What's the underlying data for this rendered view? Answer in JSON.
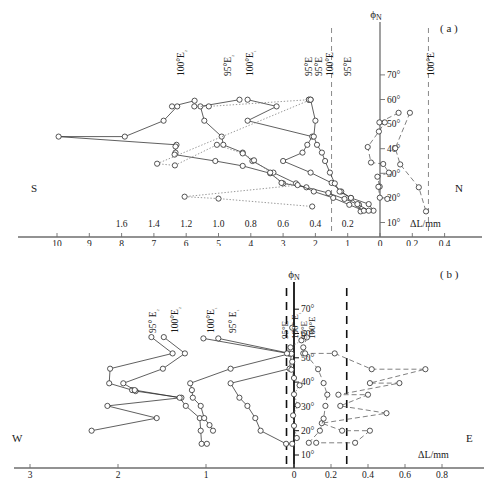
{
  "figure": {
    "panels": [
      {
        "id": "a",
        "tag": "( a )",
        "left_direction": "S",
        "right_direction": "N",
        "yaxis_symbol": "ϕ",
        "yaxis_subscript": "N",
        "xaxis_label": "ΔL/mm",
        "lat_ticks": [
          "10°",
          "20°",
          "30°",
          "40°",
          "50°",
          "60°",
          "70°"
        ],
        "upper_scale_ticks": [
          "1.6",
          "1.4",
          "1.2",
          "1.0",
          "0.8",
          "0.6",
          "0.4",
          "0.2"
        ],
        "lower_scale_ticks": [
          "10",
          "9",
          "8",
          "7",
          "6",
          "5",
          "4",
          "3",
          "2",
          "1",
          "0",
          "0.2",
          "0.4"
        ],
        "series_labels_top": [
          "100°E₂",
          "95°E₂",
          "100°E₁",
          "95°E",
          "95°E",
          "100°E"
        ],
        "series_labels_right": [
          "95°E",
          "100°E"
        ],
        "dashed_guides": [
          1.5,
          -0.3
        ]
      },
      {
        "id": "b",
        "tag": "( b )",
        "left_direction": "W",
        "right_direction": "E",
        "yaxis_symbol": "ϕ",
        "yaxis_subscript": "N",
        "xaxis_label": "ΔL/mm",
        "lat_ticks": [
          "10°",
          "20°",
          "30°",
          "40°",
          "50°",
          "60°",
          "70°"
        ],
        "lower_scale_ticks": [
          "3",
          "2",
          "1",
          "0",
          "0.2",
          "0.4",
          "0.6",
          "0.8"
        ],
        "series_labels_top": [
          "95° E₂",
          "100°E₂",
          "100°E₁",
          "95° E₁"
        ],
        "series_labels_axis": [
          "95°E",
          "100° E₁",
          "95°E",
          "100°E"
        ],
        "dashed_guides": [
          -0.08,
          0.285
        ]
      }
    ]
  },
  "chart_data": [
    {
      "type": "scatter",
      "panel": "a",
      "title": "",
      "xlabel": "ΔL/mm",
      "ylabel": "ϕN",
      "xlim": [
        10.2,
        -0.5
      ],
      "ylim": [
        5,
        75
      ],
      "grid": false,
      "legend": "inline-rotated-labels",
      "note": "Left of zero uses coarse scale (10..0 mm), right of zero uses fine scale (0..0.4 mm). Secondary upper tick row 1.6..0.2 aligns with lower 8..1.",
      "series": [
        {
          "name": "100°E₂",
          "style": "solid",
          "points": [
            [
              5.74,
              59.5
            ],
            [
              6.44,
              57.2
            ],
            [
              6.28,
              57.2
            ],
            [
              6.7,
              51.4
            ],
            [
              7.9,
              44.9
            ],
            [
              9.95,
              44.9
            ],
            [
              6.3,
              41.6
            ],
            [
              6.33,
              40.9
            ],
            [
              6.33,
              38.4
            ],
            [
              6.36,
              37.6
            ],
            [
              5.1,
              35.0
            ],
            [
              4.25,
              33.0
            ],
            [
              3.4,
              30.0
            ],
            [
              3.0,
              25.9
            ],
            [
              2.28,
              24.3
            ],
            [
              1.6,
              22.0
            ],
            [
              1.1,
              19.6
            ],
            [
              0.65,
              17.2
            ],
            [
              0.6,
              14.5
            ]
          ]
        },
        {
          "name": "95°E₂",
          "style": "solid",
          "points": [
            [
              4.35,
              59.9
            ],
            [
              5.56,
              57.2
            ],
            [
              5.44,
              51.4
            ],
            [
              4.9,
              44.9
            ],
            [
              4.85,
              41.6
            ],
            [
              4.25,
              38.4
            ],
            [
              3.95,
              35.0
            ],
            [
              3.3,
              30.3
            ],
            [
              2.6,
              25.9
            ],
            [
              2.05,
              22.6
            ],
            [
              1.45,
              20.0
            ],
            [
              0.95,
              17.2
            ],
            [
              0.5,
              14.8
            ]
          ]
        },
        {
          "name": "100°E₁",
          "style": "solid",
          "points": [
            [
              4.1,
              59.9
            ],
            [
              3.2,
              57.2
            ],
            [
              4.1,
              51.4
            ],
            [
              2.1,
              44.9
            ],
            [
              2.25,
              41.6
            ],
            [
              2.4,
              38.4
            ],
            [
              3.0,
              35.0
            ],
            [
              2.15,
              30.3
            ],
            [
              1.5,
              26.1
            ],
            [
              1.2,
              22.6
            ],
            [
              0.9,
              20.0
            ],
            [
              0.35,
              17.5
            ],
            [
              0.2,
              14.8
            ]
          ]
        },
        {
          "name": "95°E",
          "style": "solid",
          "points": [
            [
              2.2,
              59.9
            ],
            [
              2.15,
              59.9
            ],
            [
              2.0,
              51.4
            ],
            [
              2.05,
              44.9
            ],
            [
              1.95,
              41.6
            ],
            [
              1.8,
              38.4
            ],
            [
              1.7,
              35.0
            ],
            [
              1.55,
              30.3
            ],
            [
              1.4,
              25.9
            ],
            [
              1.25,
              22.6
            ],
            [
              0.9,
              20.0
            ],
            [
              0.7,
              17.5
            ],
            [
              0.35,
              14.8
            ]
          ]
        },
        {
          "name": "100°E dotted",
          "style": "dotted",
          "points": [
            [
              5.75,
              57.2
            ],
            [
              5.3,
              57.2
            ],
            [
              2.2,
              59.9
            ],
            [
              2.15,
              59.9
            ],
            [
              6.9,
              33.9
            ],
            [
              6.35,
              33.2
            ],
            [
              5.05,
              41.6
            ],
            [
              4.25,
              38.1
            ],
            [
              3.9,
              35.3
            ],
            [
              3.4,
              30.3
            ],
            [
              3.05,
              26.1
            ],
            [
              2.55,
              25.2
            ],
            [
              6.05,
              20.5
            ],
            [
              5.0,
              19.7
            ],
            [
              2.1,
              16.5
            ]
          ]
        },
        {
          "name": "95°E right",
          "style": "dashed",
          "points": [
            [
              -0.115,
              54.6
            ],
            [
              0.02,
              50.7
            ],
            [
              -0.03,
              50.7
            ],
            [
              0.035,
              47.0
            ],
            [
              0.38,
              40.7
            ],
            [
              0.28,
              34.4
            ],
            [
              -0.02,
              33.8
            ],
            [
              -0.055,
              30.3
            ],
            [
              0.08,
              28.6
            ],
            [
              0.01,
              24.6
            ],
            [
              0.05,
              24.5
            ],
            [
              0.005,
              20.1
            ],
            [
              -0.045,
              19.6
            ]
          ]
        },
        {
          "name": "100°E right",
          "style": "dashed",
          "points": [
            [
              -0.185,
              54.6
            ],
            [
              -0.095,
              40.2
            ],
            [
              -0.125,
              33.6
            ],
            [
              -0.24,
              24.3
            ],
            [
              -0.285,
              14.5
            ]
          ]
        }
      ]
    },
    {
      "type": "scatter",
      "panel": "b",
      "title": "",
      "xlabel": "ΔL/mm",
      "ylabel": "ϕN",
      "xlim": [
        3.2,
        -0.95
      ],
      "ylim": [
        5,
        75
      ],
      "grid": false,
      "legend": "inline-rotated-labels",
      "note": "Left of zero uses coarse scale (3..0 mm); right of zero uses fine scale (0..0.8 mm).",
      "series": [
        {
          "name": "95° E₂",
          "style": "solid",
          "points": [
            [
              1.62,
              58.5
            ],
            [
              1.38,
              51.8
            ],
            [
              2.09,
              45.5
            ],
            [
              2.1,
              39.5
            ],
            [
              1.84,
              36.7
            ],
            [
              1.8,
              36.3
            ],
            [
              1.28,
              33.6
            ],
            [
              2.12,
              30.2
            ],
            [
              1.56,
              25.2
            ],
            [
              2.3,
              20.0
            ]
          ]
        },
        {
          "name": "100°E₂",
          "style": "solid",
          "points": [
            [
              1.48,
              58.5
            ],
            [
              1.24,
              51.8
            ],
            [
              1.49,
              45.5
            ],
            [
              1.94,
              39.5
            ],
            [
              1.81,
              36.7
            ],
            [
              1.3,
              33.6
            ],
            [
              1.23,
              30.2
            ],
            [
              1.07,
              25.2
            ],
            [
              1.06,
              20.0
            ],
            [
              1.05,
              14.6
            ],
            [
              0.99,
              14.6
            ]
          ]
        },
        {
          "name": "100°E₁",
          "style": "solid",
          "points": [
            [
              1.03,
              58.0
            ],
            [
              0.05,
              51.7
            ],
            [
              0.72,
              45.5
            ],
            [
              1.18,
              39.5
            ],
            [
              1.16,
              36.7
            ],
            [
              1.15,
              33.6
            ],
            [
              1.06,
              30.2
            ],
            [
              1.02,
              25.2
            ],
            [
              0.96,
              22.3
            ],
            [
              0.92,
              20.0
            ]
          ]
        },
        {
          "name": "95° E₁",
          "style": "solid",
          "points": [
            [
              0.86,
              58.0
            ],
            [
              0.03,
              51.7
            ],
            [
              0.05,
              45.5
            ],
            [
              0.72,
              39.5
            ],
            [
              0.62,
              33.6
            ],
            [
              0.53,
              30.2
            ],
            [
              0.44,
              25.2
            ],
            [
              0.38,
              20.0
            ],
            [
              0.09,
              14.6
            ],
            [
              0.02,
              14.6
            ]
          ]
        },
        {
          "name": "95°E axis",
          "style": "dotted",
          "points": [
            [
              0.02,
              62.4
            ],
            [
              -0.04,
              57.2
            ],
            [
              0.04,
              54.3
            ],
            [
              0.08,
              51.8
            ],
            [
              0.02,
              48.4
            ],
            [
              0.03,
              45.1
            ],
            [
              0.0,
              41.7
            ],
            [
              -0.03,
              38.7
            ],
            [
              0.0,
              35.0
            ],
            [
              -0.02,
              30.5
            ],
            [
              0.01,
              26.3
            ],
            [
              0.0,
              22.0
            ],
            [
              -0.015,
              17.0
            ]
          ]
        },
        {
          "name": "100°E right dashed A",
          "style": "dashed",
          "points": [
            [
              -0.07,
              58.4
            ],
            [
              -0.05,
              54.3
            ],
            [
              -0.05,
              51.8
            ],
            [
              -0.22,
              51.8
            ],
            [
              -0.42,
              45.3
            ],
            [
              -0.71,
              45.3
            ],
            [
              -0.41,
              39.6
            ],
            [
              -0.57,
              39.6
            ],
            [
              -0.24,
              34.8
            ],
            [
              -0.4,
              34.8
            ],
            [
              -0.25,
              30.2
            ],
            [
              -0.5,
              27.2
            ],
            [
              -0.15,
              23.1
            ],
            [
              -0.26,
              20.0
            ],
            [
              -0.41,
              20.0
            ],
            [
              -0.33,
              15.0
            ],
            [
              -0.12,
              15.0
            ]
          ]
        },
        {
          "name": "100°E right dashed B",
          "style": "dashed",
          "points": [
            [
              -0.06,
              51.8
            ],
            [
              -0.13,
              45.3
            ],
            [
              -0.16,
              39.6
            ],
            [
              -0.18,
              34.8
            ],
            [
              -0.17,
              30.2
            ],
            [
              -0.16,
              25.0
            ],
            [
              -0.14,
              20.0
            ],
            [
              -0.08,
              15.0
            ]
          ]
        }
      ]
    }
  ]
}
